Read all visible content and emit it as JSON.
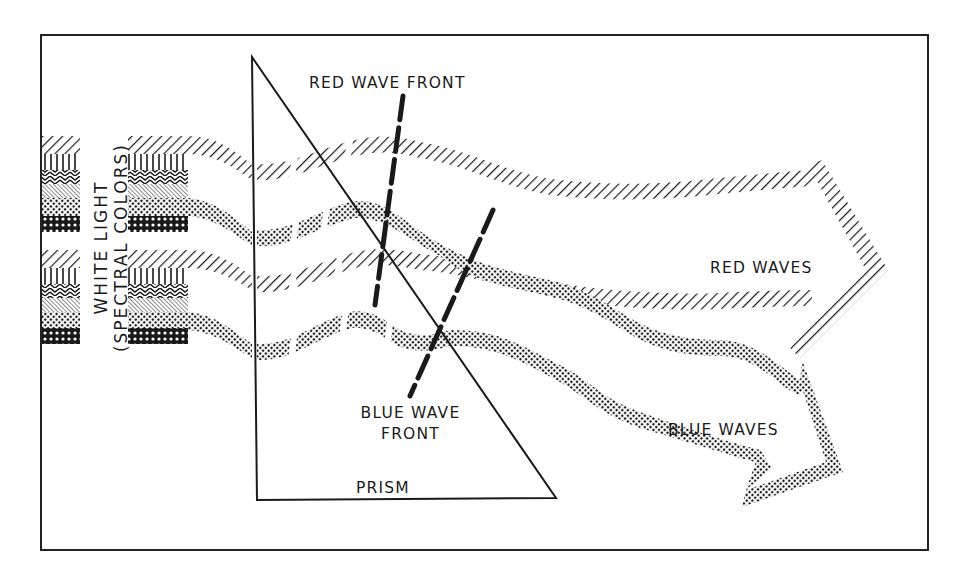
{
  "diagram": {
    "colors": {
      "ink": "#1a1a1a",
      "background": "#ffffff",
      "frame": "#222222"
    },
    "labels": {
      "white_light_line1": "WHITE LIGHT",
      "white_light_line2": "(SPECTRAL COLORS)",
      "red_wave_front": "RED WAVE FRONT",
      "blue_wave_front_line1": "BLUE WAVE",
      "blue_wave_front_line2": "FRONT",
      "prism": "PRISM",
      "red_waves": "RED WAVES",
      "blue_waves": "BLUE WAVES"
    },
    "nodes": [
      {
        "id": "white-light-source",
        "label": "WHITE LIGHT (SPECTRAL COLORS)",
        "shape": "patterned-stacks"
      },
      {
        "id": "prism",
        "label": "PRISM",
        "shape": "right-triangle"
      },
      {
        "id": "red-wave-front",
        "label": "RED WAVE FRONT",
        "shape": "dashed-line"
      },
      {
        "id": "blue-wave-front",
        "label": "BLUE WAVE FRONT",
        "shape": "dashed-line"
      },
      {
        "id": "red-waves",
        "label": "RED WAVES",
        "shape": "hatched-arrow"
      },
      {
        "id": "blue-waves",
        "label": "BLUE WAVES",
        "shape": "dotted-arrow"
      }
    ],
    "edges": [
      {
        "from": "white-light-source",
        "to": "prism",
        "label": "light enters"
      },
      {
        "from": "prism",
        "to": "red-waves",
        "label": "less refraction"
      },
      {
        "from": "prism",
        "to": "blue-waves",
        "label": "more refraction"
      }
    ]
  }
}
